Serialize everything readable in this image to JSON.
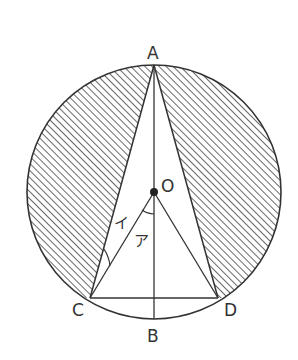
{
  "diagram": {
    "type": "geometry-figure",
    "points": {
      "A": {
        "label": "A",
        "x": 154,
        "y": 65
      },
      "O": {
        "label": "O",
        "x": 154,
        "y": 192
      },
      "B": {
        "label": "B",
        "x": 154,
        "y": 319
      },
      "C": {
        "label": "C",
        "x": 90,
        "y": 298
      },
      "D": {
        "label": "D",
        "x": 218,
        "y": 298
      }
    },
    "circle": {
      "cx": 154,
      "cy": 192,
      "r": 127
    },
    "segments": [
      "AC",
      "AD",
      "CD",
      "AB",
      "OC",
      "OD"
    ],
    "angles": {
      "a": {
        "label": "ア",
        "at": "O",
        "between": [
          "OB",
          "OC"
        ]
      },
      "i": {
        "label": "イ",
        "at": "C",
        "between": [
          "CA",
          "CO"
        ]
      }
    },
    "colors": {
      "stroke": "#333333",
      "hatch": "#444444",
      "background": "#ffffff"
    }
  }
}
